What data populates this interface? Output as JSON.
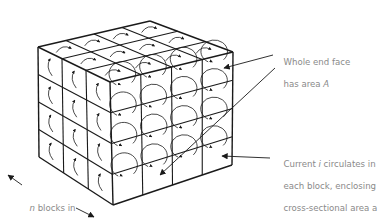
{
  "figure": {
    "grid": {
      "rows": 4,
      "cols": 4,
      "depth": 3
    }
  },
  "labels": {
    "end_face": {
      "line1": "Whole end face",
      "line2_prefix": "has area ",
      "line2_var": "A"
    },
    "current": {
      "line1_prefix": "Current ",
      "line1_var": "i",
      "line1_suffix": " circulates in",
      "line2": "each block, enclosing",
      "line3": "cross-sectional area a"
    },
    "length": {
      "line1_var": "n",
      "line1_suffix": " blocks in",
      "line2": "this length"
    }
  },
  "colors": {
    "line": "#1a1a1a",
    "text": "#8a8a8a",
    "background": "#ffffff"
  }
}
